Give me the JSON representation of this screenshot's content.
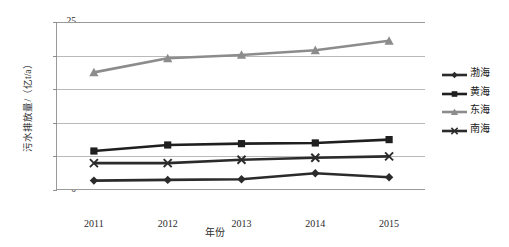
{
  "chart_data": {
    "type": "line",
    "title": "",
    "xlabel": "年份",
    "ylabel": "污水排放量/（亿t/a）",
    "categories": [
      "2011",
      "2012",
      "2013",
      "2014",
      "2015"
    ],
    "x": [
      2011,
      2012,
      2013,
      2014,
      2015
    ],
    "ylim": [
      0,
      25
    ],
    "yticks": [
      0,
      5,
      10,
      15,
      20,
      25
    ],
    "grid": true,
    "legend_position": "right",
    "series": [
      {
        "name": "渤海",
        "values": [
          1.4,
          1.5,
          1.6,
          2.5,
          1.9
        ],
        "color": "#2b2b2b",
        "marker": "diamond"
      },
      {
        "name": "黄海",
        "values": [
          5.8,
          6.7,
          6.9,
          7.0,
          7.5
        ],
        "color": "#1f1f1f",
        "marker": "square"
      },
      {
        "name": "东海",
        "values": [
          17.5,
          19.6,
          20.1,
          20.8,
          22.2
        ],
        "color": "#8c8c8c",
        "marker": "triangle"
      },
      {
        "name": "南海",
        "values": [
          4.0,
          4.0,
          4.5,
          4.8,
          5.0
        ],
        "color": "#2b2b2b",
        "marker": "cross"
      }
    ]
  }
}
